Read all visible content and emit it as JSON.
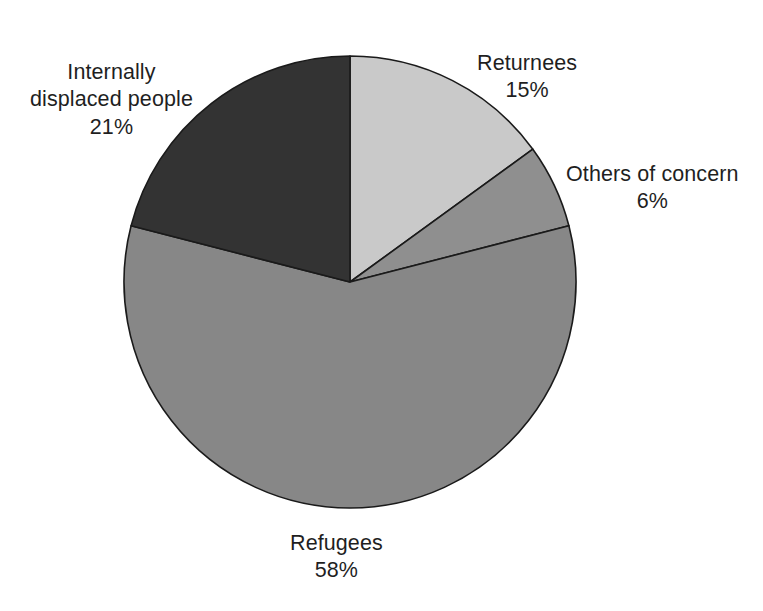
{
  "chart_data": {
    "type": "pie",
    "title": "",
    "subtitle": "",
    "xlabel": "",
    "ylabel": "",
    "legend_position": "none",
    "grid": false,
    "start_angle_deg": 90,
    "direction": "clockwise",
    "units": "percent",
    "total": 100,
    "categories": [
      "Returnees",
      "Others of concern",
      "Refugees",
      "Internally displaced people"
    ],
    "values": [
      15,
      6,
      58,
      21
    ],
    "labels": [
      "15%",
      "6%",
      "58%",
      "21%"
    ],
    "colors": [
      "#c9c9c9",
      "#8f8f8f",
      "#878787",
      "#333333"
    ],
    "slices": [
      {
        "name": "Returnees",
        "value": 15,
        "value_label": "15%",
        "color": "#c9c9c9",
        "start_deg": 0,
        "end_deg": 54
      },
      {
        "name": "Others of concern",
        "value": 6,
        "value_label": "6%",
        "color": "#8f8f8f",
        "start_deg": 54,
        "end_deg": 75.6
      },
      {
        "name": "Refugees",
        "value": 58,
        "value_label": "58%",
        "color": "#878787",
        "start_deg": 75.6,
        "end_deg": 284.4
      },
      {
        "name": "Internally displaced people",
        "value": 21,
        "value_label": "21%",
        "color": "#333333",
        "start_deg": 284.4,
        "end_deg": 360
      }
    ]
  },
  "labels": {
    "returnees": {
      "name": "Returnees",
      "value": "15%"
    },
    "others": {
      "name": "Others of concern",
      "value": "6%"
    },
    "refugees": {
      "name": "Refugees",
      "value": "58%"
    },
    "idp": {
      "name_line1": "Internally",
      "name_line2": "displaced people",
      "value": "21%"
    }
  },
  "style": {
    "background": "#ffffff",
    "text_color": "#1f1f1f",
    "outline_color": "#1a1a1a"
  }
}
